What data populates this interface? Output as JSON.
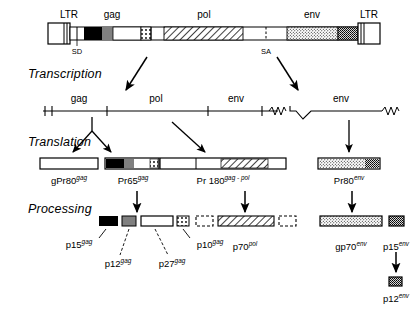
{
  "figure": {
    "stages": [
      {
        "id": "transcription",
        "label": "Transcription"
      },
      {
        "id": "translation",
        "label": "Translation"
      },
      {
        "id": "processing",
        "label": "Processing"
      }
    ]
  },
  "genome": {
    "ltr_left": "LTR",
    "ltr_right": "LTR",
    "genes": [
      "gag",
      "pol",
      "env"
    ],
    "sites": {
      "splice_donor": "SD",
      "splice_acceptor": "SA"
    },
    "segments": [
      {
        "name": "ltr-left",
        "fill": "white-striped",
        "x": 48,
        "w": 22
      },
      {
        "name": "leader",
        "fill": "white",
        "x": 70,
        "w": 14
      },
      {
        "name": "gag-p15",
        "fill": "black",
        "x": 84,
        "w": 18
      },
      {
        "name": "gag-p12",
        "fill": "gray",
        "x": 102,
        "w": 11
      },
      {
        "name": "gag-p27",
        "fill": "white",
        "x": 113,
        "w": 28
      },
      {
        "name": "gag-p10",
        "fill": "dotted",
        "x": 141,
        "w": 10
      },
      {
        "name": "spacer-1",
        "fill": "white",
        "x": 151,
        "w": 13
      },
      {
        "name": "pol-p70",
        "fill": "hatched",
        "x": 164,
        "w": 79
      },
      {
        "name": "spacer-2",
        "fill": "white",
        "x": 243,
        "w": 44
      },
      {
        "name": "env-gp70",
        "fill": "stipple",
        "x": 287,
        "w": 51
      },
      {
        "name": "env-p15",
        "fill": "stipple-dark",
        "x": 338,
        "w": 20
      },
      {
        "name": "ltr-right",
        "fill": "white-striped",
        "x": 358,
        "w": 22
      }
    ]
  },
  "transcripts": [
    {
      "id": "genomic-rna",
      "genes": [
        "gag",
        "pol",
        "env"
      ],
      "x": 42,
      "w": 236,
      "y": 104,
      "type": "unspliced"
    },
    {
      "id": "spliced-env-mrna",
      "genes": [
        "env"
      ],
      "x": 288,
      "w": 100,
      "y": 104,
      "type": "spliced"
    }
  ],
  "translation_products": [
    {
      "id": "gPr80gag",
      "base": "gPr80",
      "sup": "gag",
      "x": 40,
      "w": 58,
      "fill": "white"
    },
    {
      "id": "Pr65gag",
      "base": "Pr65",
      "sup": "gag",
      "x": 105,
      "w": 54,
      "fill": "gag-composite"
    },
    {
      "id": "Pr180gag-pol",
      "base": "Pr 180",
      "sup": "gag - pol",
      "x": 160,
      "w": 126,
      "fill": "gagpol-composite"
    },
    {
      "id": "Pr80env",
      "base": "Pr80",
      "sup": "env",
      "x": 318,
      "w": 62,
      "fill": "env-composite"
    }
  ],
  "processing_products": [
    {
      "id": "p15gag",
      "base": "p15",
      "sup": "gag",
      "x": 99,
      "w": 19,
      "fill": "black"
    },
    {
      "id": "p12gag",
      "base": "p12",
      "sup": "gag",
      "x": 122,
      "w": 14,
      "fill": "gray"
    },
    {
      "id": "p27gag",
      "base": "p27",
      "sup": "gag",
      "x": 141,
      "w": 32,
      "fill": "white"
    },
    {
      "id": "p10gag",
      "base": "p10",
      "sup": "gag",
      "x": 177,
      "w": 12,
      "fill": "dotted"
    },
    {
      "id": "pol-left-ghost",
      "base": "",
      "sup": "",
      "x": 196,
      "w": 17,
      "fill": "dashed"
    },
    {
      "id": "p70pol",
      "base": "p70",
      "sup": "pol",
      "x": 218,
      "w": 56,
      "fill": "hatched"
    },
    {
      "id": "pol-right-ghost",
      "base": "",
      "sup": "",
      "x": 279,
      "w": 17,
      "fill": "dashed"
    },
    {
      "id": "gp70env",
      "base": "gp70",
      "sup": "env",
      "x": 320,
      "w": 62,
      "fill": "stipple"
    },
    {
      "id": "p15env",
      "base": "p15",
      "sup": "env",
      "x": 389,
      "w": 15,
      "fill": "stipple-dark"
    },
    {
      "id": "p12env",
      "base": "p12",
      "sup": "env",
      "x": 389,
      "w": 13,
      "fill": "stipple-dark"
    }
  ],
  "colors": {
    "ink": "#000000",
    "gray_fill": "#808080",
    "white_fill": "#ffffff",
    "background": "#ffffff"
  }
}
